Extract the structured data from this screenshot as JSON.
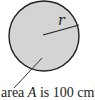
{
  "figure": {
    "shape": "circle",
    "fill_color": "#d4d4d4",
    "stroke_color": "#222222",
    "radius_label": "r",
    "area_label": {
      "prefix": "area ",
      "variable": "A",
      "middle": " is 100 cm",
      "superscript": "2"
    }
  }
}
